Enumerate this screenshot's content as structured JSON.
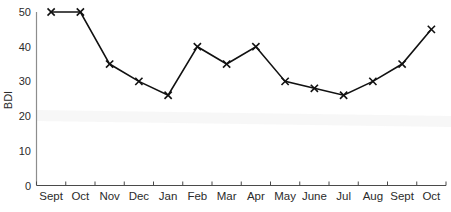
{
  "chart_data": {
    "type": "line",
    "title": "",
    "xlabel": "",
    "ylabel": "BDI",
    "categories": [
      "Sept",
      "Oct",
      "Nov",
      "Dec",
      "Jan",
      "Feb",
      "Mar",
      "Apr",
      "May",
      "June",
      "Jul",
      "Aug",
      "Sept",
      "Oct"
    ],
    "values": [
      50,
      50,
      35,
      30,
      26,
      40,
      35,
      40,
      30,
      28,
      26,
      30,
      35,
      45
    ],
    "series": [
      {
        "name": "BDI",
        "values": [
          50,
          50,
          35,
          30,
          26,
          40,
          35,
          40,
          30,
          28,
          26,
          30,
          35,
          45
        ]
      }
    ],
    "ylim": [
      0,
      50
    ],
    "y_ticks": [
      0,
      10,
      20,
      30,
      40,
      50
    ],
    "y_tick_labels": [
      "0",
      "10",
      "20",
      "30",
      "40",
      "50"
    ],
    "grid": false,
    "legend": "none",
    "marker": "x",
    "line_color": "#111111",
    "marker_color": "#111111",
    "axis_color": "#8d8d8d",
    "background_color": "#ffffff"
  },
  "axes": {
    "y_axis_title": "BDI"
  }
}
